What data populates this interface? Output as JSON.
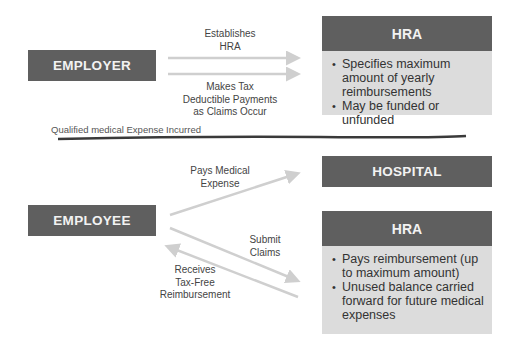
{
  "top_section": {
    "employer": {
      "label": "EMPLOYER"
    },
    "arrow_establishes": {
      "label": "Establishes\nHRA"
    },
    "arrow_payments": {
      "label": "Makes Tax\nDeductible Payments\nas Claims Occur"
    },
    "hra": {
      "title": "HRA",
      "bullets": [
        "Specifies maximum amount of yearly reimbursements",
        "May be funded or unfunded"
      ]
    }
  },
  "divider": {
    "label": "Qualified medical Expense Incurred"
  },
  "bottom_section": {
    "employee": {
      "label": "EMPLOYEE"
    },
    "hospital": {
      "label": "HOSPITAL"
    },
    "arrow_pays_medical": {
      "label": "Pays Medical\nExpense"
    },
    "arrow_submit_claims": {
      "label": "Submit\nClaims"
    },
    "arrow_receives": {
      "label": "Receives\nTax-Free\nReimbursement"
    },
    "hra": {
      "title": "HRA",
      "bullets": [
        "Pays reimbursement (up to maximum amount)",
        "Unused balance carried forward for future medical expenses"
      ]
    }
  },
  "colors": {
    "box_dark": "#5f5f5f",
    "box_light": "#dcdcdc",
    "arrow": "#cfcfcf",
    "divider": "#3a3a3a"
  }
}
